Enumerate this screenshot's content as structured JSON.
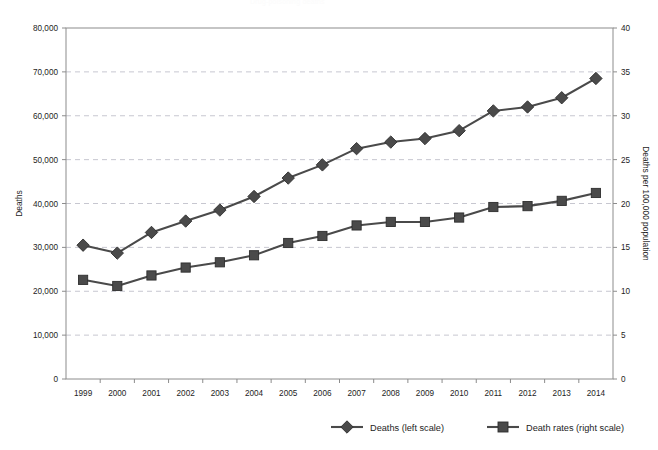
{
  "faint_top_text": "Drug-poisoning deaths",
  "chart_data": {
    "type": "line",
    "title": "",
    "subtitle": "",
    "xlabel": "",
    "ylabel": "Deaths",
    "y2label": "Deaths per 100,000 population",
    "grid": true,
    "legend_position": "bottom",
    "categories": [
      "1999",
      "2000",
      "2001",
      "2002",
      "2003",
      "2004",
      "2005",
      "2006",
      "2007",
      "2008",
      "2009",
      "2010",
      "2011",
      "2012",
      "2013",
      "2014"
    ],
    "ylim": [
      0,
      80000
    ],
    "yticks": [
      "0",
      "10,000",
      "20,000",
      "30,000",
      "40,000",
      "50,000",
      "60,000",
      "70,000",
      "80,000"
    ],
    "ytick_values": [
      0,
      10000,
      20000,
      30000,
      40000,
      50000,
      60000,
      70000,
      80000
    ],
    "y2lim": [
      0,
      40
    ],
    "y2ticks": [
      "0",
      "5",
      "10",
      "15",
      "20",
      "25",
      "30",
      "35",
      "40"
    ],
    "y2tick_values": [
      0,
      5,
      10,
      15,
      20,
      25,
      30,
      35,
      40
    ],
    "series": [
      {
        "name": "Deaths (left scale)",
        "axis": "left",
        "marker": "diamond",
        "color": "#4a4a4a",
        "values": [
          30500,
          28700,
          33400,
          36000,
          38500,
          41600,
          45800,
          48800,
          52500,
          54000,
          54800,
          56600,
          61100,
          62000,
          64100,
          68500
        ]
      },
      {
        "name": "Death rates (right scale)",
        "axis": "right",
        "marker": "square",
        "color": "#4a4a4a",
        "values": [
          11.3,
          10.6,
          11.8,
          12.7,
          13.3,
          14.1,
          15.5,
          16.3,
          17.5,
          17.9,
          17.9,
          18.4,
          19.6,
          19.7,
          20.3,
          21.2
        ]
      }
    ],
    "legend": [
      {
        "label": "Deaths (left scale)",
        "marker": "diamond",
        "color": "#4a4a4a"
      },
      {
        "label": "Death rates (right scale)",
        "marker": "square",
        "color": "#4a4a4a"
      }
    ]
  }
}
